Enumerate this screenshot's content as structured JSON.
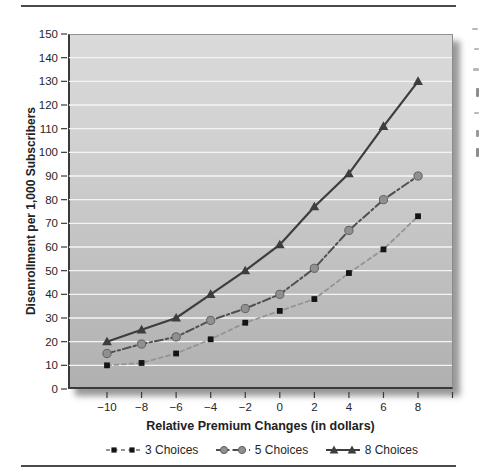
{
  "chart_data": {
    "type": "line",
    "x": [
      -10,
      -8,
      -6,
      -4,
      -2,
      0,
      2,
      4,
      6,
      8
    ],
    "series": [
      {
        "name": "3 Choices",
        "values": [
          10,
          11,
          15,
          21,
          28,
          33,
          38,
          49,
          59,
          73
        ],
        "marker": "square",
        "marker_color": "#141414",
        "marker_stroke": "none",
        "line_color": "#949494",
        "dash": "4 3.5",
        "width": 1.8
      },
      {
        "name": "5 Choices",
        "values": [
          15,
          19,
          22,
          29,
          34,
          40,
          51,
          67,
          80,
          90
        ],
        "marker": "circle",
        "marker_color": "#909090",
        "marker_stroke": "#5f5f5f",
        "line_color": "#4f4f4f",
        "dash": "8 3 2.5 3",
        "width": 2
      },
      {
        "name": "8 Choices",
        "values": [
          20,
          25,
          30,
          40,
          50,
          61,
          77,
          91,
          111,
          130
        ],
        "marker": "triangle",
        "marker_color": "#3d3d3d",
        "marker_stroke": "none",
        "line_color": "#3d3d3d",
        "dash": "",
        "width": 2.2
      }
    ],
    "title": "",
    "xlabel": "Relative Premium Changes (in dollars)",
    "ylabel": "Disenrollment per 1,000 Subscribers",
    "ylim": [
      0,
      150
    ],
    "y_ticks": [
      0,
      10,
      20,
      30,
      40,
      50,
      60,
      70,
      80,
      90,
      100,
      110,
      120,
      130,
      140,
      150
    ],
    "x_ticks": [
      -10,
      -8,
      -6,
      -4,
      -2,
      0,
      2,
      4,
      6,
      8
    ],
    "grid": true,
    "legend_position": "bottom",
    "colors": {
      "plot_bg_top": "#dadada",
      "plot_bg_bottom": "#b0b0b0",
      "gridline": "#f4f4f4",
      "axis": "#3a3a3a",
      "text": "#262626",
      "rule": "#4a4a4a"
    }
  }
}
